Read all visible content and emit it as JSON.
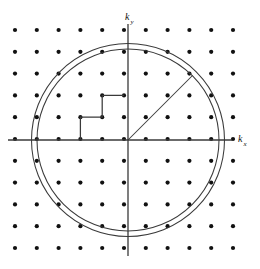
{
  "figure": {
    "title": "",
    "caption_fragment": "",
    "background_color": "#ffffff",
    "stroke_color": "#3a3a3a",
    "dot_color": "#111111",
    "width": 260,
    "height": 269
  },
  "axes": {
    "x_label_main": "k",
    "x_label_sub": "x",
    "y_label_main": "k",
    "y_label_sub": "y",
    "origin": {
      "x": 128,
      "y": 140
    },
    "x_axis_line": {
      "x1": 8,
      "y1": 140,
      "x2": 232,
      "y2": 140
    },
    "y_axis_line": {
      "x1": 128,
      "y1": 24,
      "x2": 128,
      "y2": 256
    },
    "x_label_pos": {
      "x": 238,
      "y": 142
    },
    "y_label_pos": {
      "x": 125,
      "y": 20
    }
  },
  "lattice": {
    "description": "reciprocal-space lattice of k-points",
    "spacing_px": 21.8,
    "dot_radius_px": 2.1,
    "columns_x": [
      15,
      36.8,
      58.6,
      80.4,
      102.2,
      124,
      145.8,
      167.6,
      189.4,
      211.2,
      233
    ],
    "rows_y": [
      30,
      51.8,
      73.6,
      95.4,
      117.2,
      139,
      160.8,
      182.6,
      204.4,
      226.2,
      248
    ],
    "col_count": 11,
    "row_count": 11
  },
  "circles": [
    {
      "name": "outer-fermi-circle",
      "cx": 128,
      "cy": 140,
      "r": 96.5
    },
    {
      "name": "inner-fermi-circle",
      "cx": 128,
      "cy": 140,
      "r": 91.0
    }
  ],
  "radius_line": {
    "name": "fermi-radius-line",
    "x1": 128,
    "y1": 140,
    "x2": 192.5,
    "y2": 75.5,
    "angle_deg": 45,
    "label": ""
  },
  "staircase": {
    "name": "staircase-boundary",
    "description": "step path enclosing lattice points near origin",
    "points": [
      {
        "x": 80.4,
        "y": 139
      },
      {
        "x": 80.4,
        "y": 117.2
      },
      {
        "x": 102.2,
        "y": 117.2
      },
      {
        "x": 102.2,
        "y": 95.4
      },
      {
        "x": 124,
        "y": 95.4
      }
    ]
  },
  "chart_data": {
    "type": "scatter",
    "title": "",
    "xlabel": "k_x",
    "ylabel": "k_y",
    "grid": false,
    "legend": "none",
    "xlim": [
      -5,
      5
    ],
    "ylim": [
      -5,
      5
    ],
    "lattice_points_x": [
      -5,
      -4,
      -3,
      -2,
      -1,
      0,
      1,
      2,
      3,
      4,
      5
    ],
    "lattice_points_y": [
      5,
      4,
      3,
      2,
      1,
      0,
      -1,
      -2,
      -3,
      -4,
      -5
    ],
    "annotations": [
      {
        "kind": "circle",
        "label": "outer circle",
        "center": [
          0,
          0
        ],
        "radius_units": 4.43
      },
      {
        "kind": "circle",
        "label": "inner circle",
        "center": [
          0,
          0
        ],
        "radius_units": 4.17
      },
      {
        "kind": "line",
        "label": "radius at 45 degrees",
        "from": [
          0,
          0
        ],
        "to": [
          2.96,
          2.96
        ]
      },
      {
        "kind": "polyline",
        "label": "staircase of lattice cells",
        "points": [
          [
            -2,
            0
          ],
          [
            -2,
            1
          ],
          [
            -1,
            1
          ],
          [
            -1,
            2
          ],
          [
            0,
            2
          ]
        ]
      }
    ]
  }
}
